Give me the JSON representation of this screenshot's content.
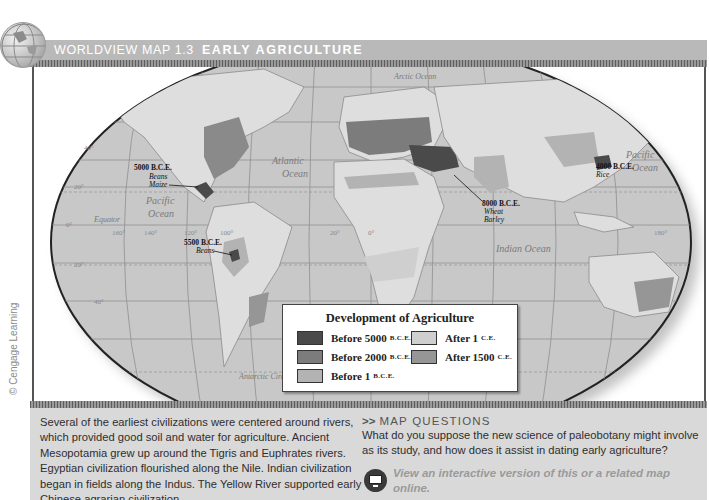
{
  "header": {
    "series": "WORLDVIEW MAP 1.3",
    "title": "EARLY AGRICULTURE"
  },
  "credit": "© Cengage Learning",
  "map": {
    "oceans": {
      "atlantic_1": "Atlantic",
      "atlantic_2": "Ocean",
      "pacific_w_1": "Pacific",
      "pacific_w_2": "Ocean",
      "pacific_e_1": "Pacific",
      "pacific_e_2": "Ocean",
      "indian": "Indian Ocean",
      "arctic": "Arctic Ocean",
      "equator": "Equator",
      "antarctic_circle": "Antarctic Circle"
    },
    "annotations": [
      {
        "date": "5000 B.C.E.",
        "crops": [
          "Beans",
          "Maize"
        ]
      },
      {
        "date": "5500 B.C.E.",
        "crops": [
          "Beans"
        ]
      },
      {
        "date": "8000 B.C.E.",
        "crops": [
          "Wheat",
          "Barley"
        ]
      },
      {
        "date": "4000 B.C.E.",
        "crops": [
          "Rice"
        ]
      }
    ],
    "graticule": {
      "lat_labels": [
        "60°",
        "40°",
        "20°",
        "0°",
        "20°",
        "40°",
        "60°"
      ],
      "lon_labels": [
        "160°",
        "140°",
        "120°",
        "100°",
        "20°",
        "0°",
        "20°",
        "80°",
        "160°",
        "180°"
      ]
    }
  },
  "legend": {
    "title": "Development of Agriculture",
    "items": [
      {
        "label": "Before 5000",
        "era": "B.C.E.",
        "color": "#4a4a4a"
      },
      {
        "label": "Before 2000",
        "era": "B.C.E.",
        "color": "#7c7c7c"
      },
      {
        "label": "Before 1",
        "era": "B.C.E.",
        "color": "#b3b3b3"
      },
      {
        "label": "After 1",
        "era": "C.E.",
        "color": "#cfcfcf"
      },
      {
        "label": "After 1500",
        "era": "C.E.",
        "color": "#969696"
      }
    ]
  },
  "caption": "Several of the earliest civilizations were centered around rivers, which provided good soil and water for agriculture. Ancient Mesopotamia grew up around the Tigris and Euphrates rivers. Egyptian civilization flourished along the Nile. Indian civilization began in fields along the Indus. The Yellow River supported early Chinese agrarian civilization.",
  "questions": {
    "arrows": ">>",
    "heading": "MAP QUESTIONS",
    "text": "What do you suppose the new science of paleobotany might involve as its study, and how does it assist in dating early agriculture?",
    "online_link": "View an interactive version of this or a related map online."
  },
  "colors": {
    "header_bg": "#b9b9b9",
    "panel_bg": "#d9d9d9",
    "ocean": "#c8c8c8",
    "land": "#dedede"
  }
}
